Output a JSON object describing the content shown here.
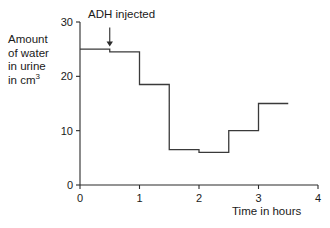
{
  "chart_data": {
    "type": "line",
    "subtype": "step",
    "title": "",
    "xlabel": "Time in hours",
    "ylabel": "Amount of water in urine in cm3",
    "ylabel_lines": [
      "Amount",
      "of water",
      "in urine",
      "in cm"
    ],
    "ylabel_superscript": "3",
    "xlim": [
      0,
      4
    ],
    "ylim": [
      0,
      30
    ],
    "xticks": [
      0,
      1,
      2,
      3,
      4
    ],
    "xtick_labels": [
      "0",
      "1",
      "2",
      "3",
      "4"
    ],
    "yticks": [
      0,
      10,
      20,
      30
    ],
    "ytick_labels": [
      "0",
      "10",
      "20",
      "30"
    ],
    "grid": false,
    "legend": false,
    "series": [
      {
        "name": "Urine volume",
        "color": "#3a3a3a",
        "steps": [
          {
            "x_start": 0,
            "x_end": 0.5,
            "value": 25
          },
          {
            "x_start": 0.5,
            "x_end": 1,
            "value": 24.5
          },
          {
            "x_start": 1,
            "x_end": 1.5,
            "value": 18.5
          },
          {
            "x_start": 1.5,
            "x_end": 2,
            "value": 6.5
          },
          {
            "x_start": 2,
            "x_end": 2.5,
            "value": 6
          },
          {
            "x_start": 2.5,
            "x_end": 3,
            "value": 10
          },
          {
            "x_start": 3,
            "x_end": 3.5,
            "value": 15
          }
        ]
      }
    ],
    "annotations": [
      {
        "text": "ADH injected",
        "arrow": true,
        "arrow_x": 0.5,
        "arrow_y_top": 29,
        "arrow_y_bottom": 25.5
      }
    ]
  },
  "colors": {
    "axis": "#2b2b2b",
    "data_line": "#3a3a3a",
    "text": "#1a1a1a",
    "background": "#ffffff"
  }
}
